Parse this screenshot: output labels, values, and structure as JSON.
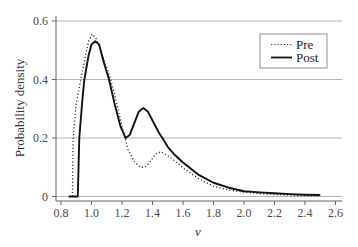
{
  "chart_data": {
    "type": "line",
    "title": "",
    "xlabel": "v",
    "ylabel": "Probability density",
    "xlim": [
      0.8,
      2.6
    ],
    "ylim": [
      0,
      0.6
    ],
    "x_ticks": [
      "0.8",
      "1.0",
      "1.2",
      "1.4",
      "1.6",
      "1.8",
      "2.0",
      "2.2",
      "2.4",
      "2.6"
    ],
    "y_ticks": [
      "0",
      "0.2",
      "0.4",
      "0.6"
    ],
    "grid": "horizontal",
    "legend_position": "upper right",
    "series": [
      {
        "name": "Pre",
        "style": "dotted",
        "color": "#333333",
        "points": [
          [
            0.875,
            0
          ],
          [
            0.877,
            0.1
          ],
          [
            0.88,
            0.2
          ],
          [
            0.9,
            0.32
          ],
          [
            0.93,
            0.4
          ],
          [
            0.96,
            0.48
          ],
          [
            0.98,
            0.53
          ],
          [
            1.005,
            0.555
          ],
          [
            1.03,
            0.54
          ],
          [
            1.06,
            0.5
          ],
          [
            1.1,
            0.44
          ],
          [
            1.126,
            0.4
          ],
          [
            1.16,
            0.33
          ],
          [
            1.2,
            0.24
          ],
          [
            1.24,
            0.16
          ],
          [
            1.28,
            0.12
          ],
          [
            1.32,
            0.1
          ],
          [
            1.35,
            0.1
          ],
          [
            1.38,
            0.115
          ],
          [
            1.42,
            0.145
          ],
          [
            1.455,
            0.153
          ],
          [
            1.5,
            0.14
          ],
          [
            1.55,
            0.12
          ],
          [
            1.6,
            0.098
          ],
          [
            1.7,
            0.062
          ],
          [
            1.8,
            0.035
          ],
          [
            1.9,
            0.022
          ],
          [
            2.0,
            0.015
          ],
          [
            2.1,
            0.01
          ],
          [
            2.2,
            0.007
          ],
          [
            2.3,
            0.005
          ],
          [
            2.4,
            0.003
          ],
          [
            2.5,
            0.002
          ]
        ]
      },
      {
        "name": "Post",
        "style": "solid",
        "color": "#111111",
        "points": [
          [
            0.85,
            0
          ],
          [
            0.91,
            0
          ],
          [
            0.915,
            0.1
          ],
          [
            0.92,
            0.2
          ],
          [
            0.94,
            0.33
          ],
          [
            0.953,
            0.4
          ],
          [
            0.98,
            0.48
          ],
          [
            1.0,
            0.52
          ],
          [
            1.025,
            0.531
          ],
          [
            1.05,
            0.52
          ],
          [
            1.08,
            0.46
          ],
          [
            1.115,
            0.4
          ],
          [
            1.15,
            0.32
          ],
          [
            1.19,
            0.24
          ],
          [
            1.224,
            0.2
          ],
          [
            1.25,
            0.21
          ],
          [
            1.28,
            0.25
          ],
          [
            1.31,
            0.29
          ],
          [
            1.34,
            0.303
          ],
          [
            1.37,
            0.29
          ],
          [
            1.4,
            0.26
          ],
          [
            1.44,
            0.22
          ],
          [
            1.465,
            0.2
          ],
          [
            1.5,
            0.17
          ],
          [
            1.55,
            0.14
          ],
          [
            1.6,
            0.116
          ],
          [
            1.7,
            0.075
          ],
          [
            1.8,
            0.047
          ],
          [
            1.9,
            0.03
          ],
          [
            2.0,
            0.018
          ],
          [
            2.1,
            0.014
          ],
          [
            2.2,
            0.011
          ],
          [
            2.3,
            0.008
          ],
          [
            2.4,
            0.006
          ],
          [
            2.5,
            0.005
          ]
        ]
      }
    ]
  },
  "legend": {
    "items": [
      {
        "label": "Pre",
        "style": "dotted"
      },
      {
        "label": "Post",
        "style": "solid"
      }
    ]
  },
  "colors": {
    "grid": "#b5b5b5",
    "axis": "#666666",
    "legend_border": "#777777"
  }
}
